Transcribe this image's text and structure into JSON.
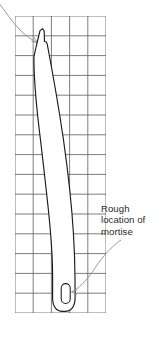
{
  "figure": {
    "background_color": "#ffffff",
    "grid": {
      "line_color": "#5a5a5a",
      "left": 15,
      "top": 16,
      "right": 106,
      "bottom": 313,
      "cell_width": 18.2,
      "cell_height": 19.8,
      "columns": 5,
      "rows": 15
    },
    "outline": {
      "stroke_color": "#1a1a1a",
      "fill_color": "#ffffff",
      "description": "Long tapered curved blank with stepped top and rounded bottom end"
    },
    "mortise": {
      "shape": "rounded-oval",
      "stroke_color": "#1a1a1a",
      "center_x": 66,
      "center_y": 293,
      "width": 9,
      "height": 20
    },
    "leaders": {
      "stroke_color": "#8a8a8a",
      "top_leader_description": "Curved leader arrow entering from upper-left toward the top shoulder of the blank",
      "mortise_leader_description": "Curved leader arrow from the annotation text down-left to the mortise oval"
    }
  },
  "annotations": {
    "mortise_label": {
      "name": "rough-location-of-mortise",
      "lines": [
        "Rough",
        "location of",
        "mortise"
      ],
      "text_color": "#2b2b2b"
    },
    "caption_partial": {
      "text": "",
      "visible": false
    }
  }
}
